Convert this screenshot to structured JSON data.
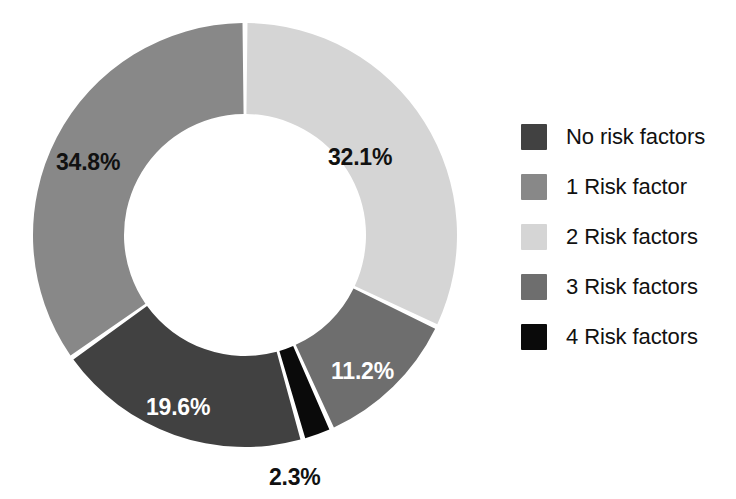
{
  "chart_data": {
    "type": "pie",
    "variant": "donut",
    "title": "",
    "subtitle": "",
    "xlabel": "",
    "ylabel": "",
    "grid": false,
    "legend_position": "right",
    "start_angle_deg": 0,
    "direction": "clockwise",
    "categories": [
      "No risk factors",
      "1 Risk factor",
      "2 Risk factors",
      "3 Risk factors",
      "4 Risk factors"
    ],
    "values": [
      19.6,
      34.8,
      32.1,
      11.2,
      2.3
    ],
    "value_labels": [
      "19.6%",
      "34.8%",
      "32.1%",
      "11.2%",
      "2.3%"
    ],
    "units": "percent",
    "colors": [
      "#414141",
      "#888888",
      "#d5d5d5",
      "#6e6e6e",
      "#0a0a0a"
    ],
    "slices_clockwise_from_top": [
      {
        "label": "2 Risk factors",
        "value": 32.1,
        "value_label": "32.1%",
        "color": "#d5d5d5",
        "label_color": "#111111"
      },
      {
        "label": "3 Risk factors",
        "value": 11.2,
        "value_label": "11.2%",
        "color": "#6e6e6e",
        "label_color": "#ffffff"
      },
      {
        "label": "4 Risk factors",
        "value": 2.3,
        "value_label": "2.3%",
        "color": "#0a0a0a",
        "label_color": "#111111"
      },
      {
        "label": "No risk factors",
        "value": 19.6,
        "value_label": "19.6%",
        "color": "#414141",
        "label_color": "#ffffff"
      },
      {
        "label": "1 Risk factor",
        "value": 34.8,
        "value_label": "34.8%",
        "color": "#888888",
        "label_color": "#111111"
      }
    ]
  },
  "slice_labels": {
    "two_risk": "32.1%",
    "three_risk": "11.2%",
    "four_risk": "2.3%",
    "no_risk": "19.6%",
    "one_risk": "34.8%"
  },
  "legend": {
    "items": [
      {
        "label": "No risk factors",
        "color": "#414141"
      },
      {
        "label": "1 Risk factor",
        "color": "#888888"
      },
      {
        "label": "2 Risk factors",
        "color": "#d5d5d5"
      },
      {
        "label": "3 Risk factors",
        "color": "#6e6e6e"
      },
      {
        "label": "4 Risk factors",
        "color": "#0a0a0a"
      }
    ]
  },
  "style": {
    "background": "#ffffff",
    "separator_color": "#ffffff"
  }
}
